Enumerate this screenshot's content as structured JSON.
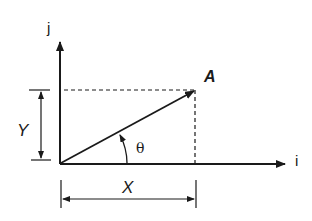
{
  "diagram": {
    "labels": {
      "j_axis": "j",
      "i_axis": "i",
      "vector": "A",
      "y_component": "Y",
      "x_component": "X",
      "angle": "θ"
    },
    "colors": {
      "stroke": "#1a1a1a",
      "background": "#ffffff"
    }
  }
}
